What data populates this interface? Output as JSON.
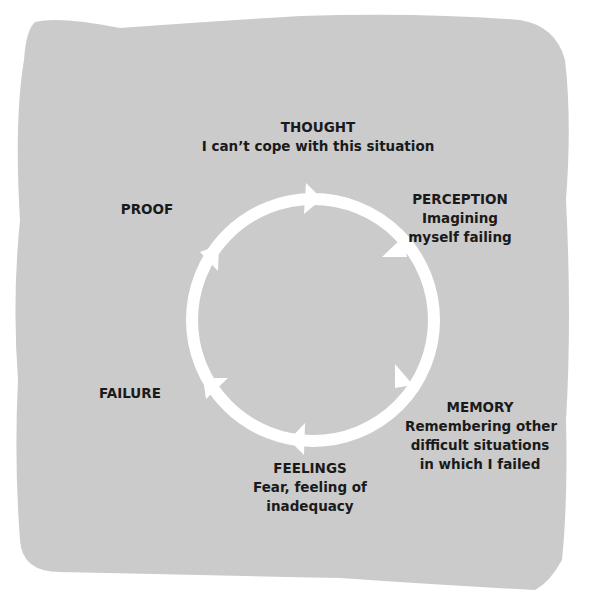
{
  "diagram": {
    "type": "cycle",
    "background_color": "#cbcbcb",
    "ring_color": "#ffffff",
    "direction": "clockwise",
    "nodes": [
      {
        "id": "thought",
        "title": "THOUGHT",
        "lines": [
          "I can’t cope with this situation"
        ]
      },
      {
        "id": "perception",
        "title": "PERCEPTION",
        "lines": [
          "Imagining",
          "myself failing"
        ]
      },
      {
        "id": "memory",
        "title": "MEMORY",
        "lines": [
          "Remembering other",
          "difficult situations",
          "in which I failed"
        ]
      },
      {
        "id": "feelings",
        "title": "FEELINGS",
        "lines": [
          "Fear, feeling of",
          "inadequacy"
        ]
      },
      {
        "id": "failure",
        "title": "FAILURE",
        "lines": []
      },
      {
        "id": "proof",
        "title": "PROOF",
        "lines": []
      }
    ]
  }
}
